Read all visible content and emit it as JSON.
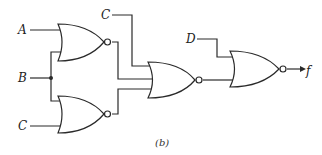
{
  "diagram": {
    "type": "logic-circuit",
    "caption": "(b)",
    "inputs": {
      "a": "A",
      "b": "B",
      "c_bottom": "C",
      "c_top": "C",
      "d": "D"
    },
    "output": "f",
    "gates": [
      {
        "id": "g1",
        "type": "NOR",
        "inputs": [
          "A",
          "B"
        ]
      },
      {
        "id": "g2",
        "type": "NOR",
        "inputs": [
          "B",
          "C"
        ]
      },
      {
        "id": "g3",
        "type": "NOR",
        "inputs": [
          "C",
          "g1",
          "g2"
        ]
      },
      {
        "id": "g4",
        "type": "NOR",
        "inputs": [
          "D",
          "g3"
        ],
        "output": "f"
      }
    ],
    "colors": {
      "line": "#2a2a2a",
      "background": "#ffffff"
    }
  }
}
